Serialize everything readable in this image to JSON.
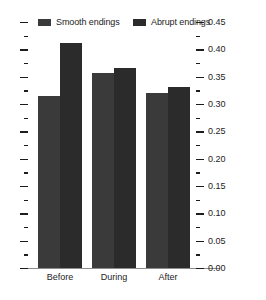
{
  "chart_data": {
    "type": "bar",
    "title": "",
    "xlabel": "",
    "ylabel": "",
    "categories": [
      "Before",
      "During",
      "After"
    ],
    "series": [
      {
        "name": "Smooth endings",
        "color": "#3a3a3a",
        "values": [
          0.315,
          0.357,
          0.32
        ]
      },
      {
        "name": "Abrupt endings",
        "color": "#2b2b2b",
        "values": [
          0.412,
          0.366,
          0.331
        ]
      }
    ],
    "ylim": [
      0.0,
      0.45
    ],
    "ytick_values": [
      0.0,
      0.05,
      0.1,
      0.15,
      0.2,
      0.25,
      0.3,
      0.35,
      0.4,
      0.45
    ],
    "ytick_labels": [
      "0.00",
      "0.05",
      "0.10",
      "0.15",
      "0.20",
      "0.25",
      "0.30",
      "0.35",
      "0.40",
      "0.45"
    ],
    "yminor_step": 0.025,
    "ytick_side": "right",
    "left_ticks_unlabeled": true,
    "grid": false,
    "legend_position": "top"
  },
  "legend": {
    "entries": [
      {
        "label": "Smooth endings",
        "color": "#3a3a3a"
      },
      {
        "label": "Abrupt endings",
        "color": "#2b2b2b"
      }
    ]
  },
  "axis": {
    "line_color": "#8c8c8c",
    "tick_color": "#1d1d1d"
  }
}
